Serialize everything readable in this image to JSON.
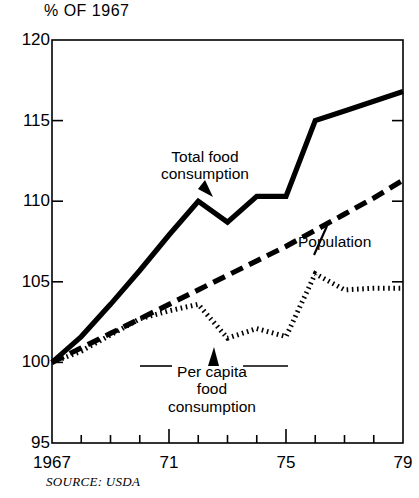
{
  "chart_data": {
    "type": "line",
    "title": "",
    "ylabel": "% OF 1967",
    "xlabel": "",
    "ylim": [
      95,
      120
    ],
    "xlim": [
      1967,
      1979
    ],
    "grid": false,
    "legend_position": "inline-annotations",
    "y_ticks": [
      95,
      100,
      105,
      110,
      115,
      120
    ],
    "y_tick_labels": [
      "95",
      "100",
      "105",
      "110",
      "115",
      "120"
    ],
    "x_ticks": [
      1967,
      1968,
      1969,
      1970,
      1971,
      1972,
      1973,
      1974,
      1975,
      1976,
      1977,
      1978,
      1979
    ],
    "x_tick_labels": [
      "1967",
      "",
      "",
      "",
      "71",
      "",
      "",
      "",
      "75",
      "",
      "",
      "",
      "79"
    ],
    "x_major_ticks": [
      1971,
      1975
    ],
    "x": [
      1967,
      1968,
      1969,
      1970,
      1971,
      1972,
      1973,
      1974,
      1975,
      1976,
      1977,
      1978,
      1979
    ],
    "series": [
      {
        "name": "Total food consumption",
        "style": "solid",
        "values": [
          100.0,
          101.6,
          103.6,
          105.7,
          107.9,
          110.0,
          108.7,
          110.3,
          110.3,
          115.0,
          115.6,
          116.2,
          116.8
        ]
      },
      {
        "name": "Population",
        "style": "dashed",
        "values": [
          100.0,
          100.9,
          101.8,
          102.7,
          103.6,
          104.5,
          105.4,
          106.3,
          107.2,
          108.2,
          109.2,
          110.2,
          111.3
        ]
      },
      {
        "name": "Per capita food consumption",
        "style": "dotted",
        "values": [
          100.0,
          100.7,
          101.7,
          102.7,
          103.2,
          103.6,
          101.5,
          102.1,
          101.6,
          105.5,
          104.5,
          104.6,
          104.6
        ]
      }
    ],
    "annotations": [
      {
        "text_line1": "Total food",
        "text_line2": "consumption",
        "target_series": "Total food consumption"
      },
      {
        "text_line1": "Population",
        "target_series": "Population"
      },
      {
        "text_line1": "Per capita",
        "text_line2": "food",
        "text_line3": "consumption",
        "target_series": "Per capita food consumption"
      }
    ],
    "source": "SOURCE: USDA",
    "colors": {
      "ink": "#000000",
      "background": "#ffffff"
    }
  },
  "labels": {
    "axis_title": "% OF 1967",
    "y": {
      "t120": "120",
      "t115": "115",
      "t110": "110",
      "t105": "105",
      "t100": "100",
      "t95": "95"
    },
    "x": {
      "x1967": "1967",
      "x71": "71",
      "x75": "75",
      "x79": "79"
    },
    "series": {
      "total_line1": "Total food",
      "total_line2": "consumption",
      "population": "Population",
      "percapita_line1": "Per capita",
      "percapita_line2": "food",
      "percapita_line3": "consumption"
    },
    "source": "SOURCE: USDA"
  }
}
